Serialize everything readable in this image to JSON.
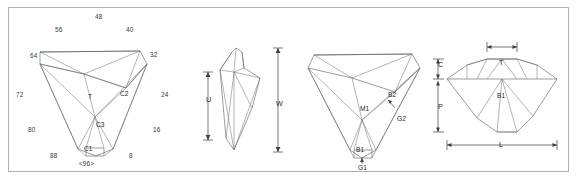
{
  "figure": {
    "frame_color": "#b0b0b0",
    "line_color": "#555b60",
    "background": "#ffffff"
  },
  "panels": [
    {
      "id": "crown-index-view",
      "name": "Crown index view",
      "index_labels": [
        {
          "value": "48",
          "x": 95,
          "y": 14
        },
        {
          "value": "56",
          "x": 55,
          "y": 27
        },
        {
          "value": "40",
          "x": 126,
          "y": 27
        },
        {
          "value": "64",
          "x": 30,
          "y": 53
        },
        {
          "value": "32",
          "x": 150,
          "y": 52
        },
        {
          "value": "72",
          "x": 16,
          "y": 92
        },
        {
          "value": "24",
          "x": 161,
          "y": 92
        },
        {
          "value": "80",
          "x": 28,
          "y": 127
        },
        {
          "value": "16",
          "x": 153,
          "y": 127
        },
        {
          "value": "88",
          "x": 50,
          "y": 153
        },
        {
          "value": "8",
          "x": 129,
          "y": 153
        }
      ],
      "facet_labels": [
        {
          "value": "T",
          "x": 88,
          "y": 94
        },
        {
          "value": "C2",
          "x": 120,
          "y": 91
        },
        {
          "value": "C3",
          "x": 96,
          "y": 122
        },
        {
          "value": "C1",
          "x": 84,
          "y": 146
        }
      ],
      "bottom_label": {
        "value": "<96>",
        "x": 79,
        "y": 161
      }
    },
    {
      "id": "girdle-profile-view",
      "name": "Side profile with U and W dimensions",
      "dimensions": [
        {
          "value": "U",
          "x": 206,
          "y": 96
        },
        {
          "value": "W",
          "x": 276,
          "y": 100
        }
      ]
    },
    {
      "id": "pavilion-view",
      "name": "Pavilion view with facet codes",
      "facet_labels": [
        {
          "value": "M1",
          "x": 360,
          "y": 106
        },
        {
          "value": "B2",
          "x": 388,
          "y": 92
        },
        {
          "value": "G2",
          "x": 397,
          "y": 116
        },
        {
          "value": "B1",
          "x": 356,
          "y": 147
        },
        {
          "value": "G1",
          "x": 358,
          "y": 165
        }
      ]
    },
    {
      "id": "side-profile-dimensions",
      "name": "Side profile with C, T, P and L dimensions",
      "dimensions": [
        {
          "value": "C",
          "x": 438,
          "y": 61
        },
        {
          "value": "T",
          "x": 499,
          "y": 59
        },
        {
          "value": "P",
          "x": 438,
          "y": 103
        },
        {
          "value": "L",
          "x": 499,
          "y": 141
        }
      ],
      "facet_labels": [
        {
          "value": "B1",
          "x": 497,
          "y": 93
        }
      ]
    }
  ]
}
